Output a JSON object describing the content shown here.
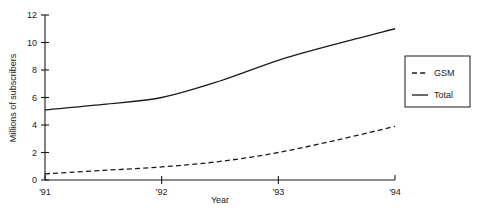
{
  "chart_data": {
    "type": "line",
    "title": "",
    "xlabel": "Year",
    "ylabel": "Millions of subscribers",
    "xlim": [
      1991,
      1994
    ],
    "ylim": [
      0,
      12
    ],
    "grid": false,
    "legend_position": "right",
    "x_tick_labels": [
      "'91",
      "'92",
      "'93",
      "'94"
    ],
    "x_tick_values": [
      1991,
      1992,
      1993,
      1994
    ],
    "y_tick_labels": [
      "0",
      "2",
      "4",
      "6",
      "8",
      "10",
      "12"
    ],
    "y_tick_values": [
      0,
      2,
      4,
      6,
      8,
      10,
      12
    ],
    "x": [
      1991,
      1991.5,
      1992,
      1992.5,
      1993,
      1993.5,
      1994
    ],
    "series": [
      {
        "name": "GSM",
        "style": "dashed",
        "color": "#1a1a1a",
        "values": [
          0.45,
          0.7,
          0.95,
          1.35,
          2.0,
          2.9,
          3.9
        ]
      },
      {
        "name": "Total",
        "style": "solid",
        "color": "#1a1a1a",
        "values": [
          5.1,
          5.5,
          6.0,
          7.2,
          8.7,
          9.9,
          11.0
        ]
      }
    ],
    "legend_entries": [
      {
        "label": "GSM",
        "style": "dashed"
      },
      {
        "label": "Total",
        "style": "solid"
      }
    ]
  }
}
